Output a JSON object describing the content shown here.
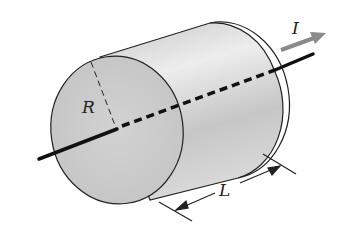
{
  "diagram": {
    "labels": {
      "radius": "R",
      "length": "L",
      "current": "I"
    },
    "colors": {
      "line": "#111111",
      "current_arrow": "#8a8a8a",
      "cylinder_fill": "#d4d4d4",
      "cylinder_highlight": "#ececec",
      "background": "#ffffff"
    }
  }
}
